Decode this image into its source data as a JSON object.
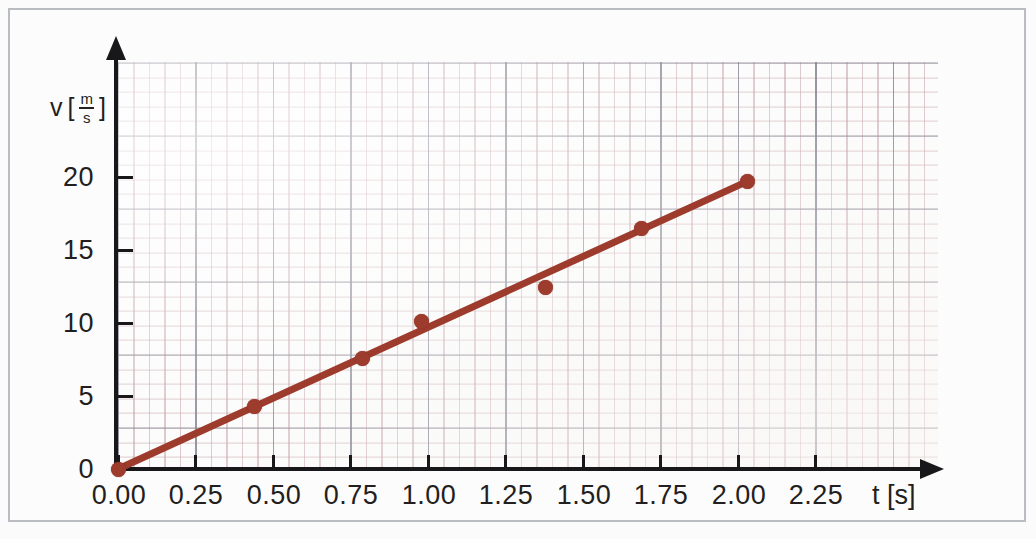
{
  "figure": {
    "kind": "velocity-time-diagram",
    "line_color": "#9d3b2d",
    "point_color": "#9d3b2d",
    "axis_color": "#18181a",
    "grid_color": "#c4a0a5",
    "grid_major_color": "#808492",
    "frame_color": "#b9bcc0",
    "background": "#fcfcfc"
  },
  "axes": {
    "y": {
      "symbol": "v",
      "unit_open": "[",
      "unit_num": "m",
      "unit_den": "s",
      "unit_close": "]",
      "label_text": "v [m/s]",
      "ticks": [
        "0",
        "5",
        "10",
        "15",
        "20"
      ],
      "tick_values": [
        0,
        5,
        10,
        15,
        20
      ]
    },
    "x": {
      "label_text": "t [s]",
      "ticks": [
        "0.00",
        "0.25",
        "0.50",
        "0.75",
        "1.00",
        "1.25",
        "1.50",
        "1.75",
        "2.00",
        "2.25"
      ],
      "tick_values": [
        0.0,
        0.25,
        0.5,
        0.75,
        1.0,
        1.25,
        1.5,
        1.75,
        2.0,
        2.25
      ]
    }
  },
  "chart_data": {
    "type": "scatter",
    "title": "",
    "xlabel": "t [s]",
    "ylabel": "v [m/s]",
    "xlim": [
      0.0,
      2.5
    ],
    "ylim": [
      0,
      22
    ],
    "grid": true,
    "legend": "none",
    "series": [
      {
        "name": "measured points",
        "kind": "scatter",
        "color": "#9d3b2d",
        "marker": "filled-circle",
        "x": [
          0.0,
          0.44,
          0.79,
          0.98,
          1.38,
          1.69,
          2.03
        ],
        "y": [
          0.0,
          4.3,
          7.6,
          10.1,
          12.4,
          16.5,
          19.7
        ],
        "points": [
          {
            "t": 0.0,
            "v": 0.0,
            "on_line": true
          },
          {
            "t": 0.44,
            "v": 4.3,
            "on_line": true
          },
          {
            "t": 0.79,
            "v": 7.6,
            "on_line": true
          },
          {
            "t": 0.98,
            "v": 10.1,
            "on_line": true
          },
          {
            "t": 1.38,
            "v": 12.4,
            "on_line": false
          },
          {
            "t": 1.69,
            "v": 16.5,
            "on_line": true
          },
          {
            "t": 2.03,
            "v": 19.7,
            "on_line": true
          }
        ]
      },
      {
        "name": "best-fit line",
        "kind": "line",
        "color": "#9d3b2d",
        "x": [
          0.0,
          2.03
        ],
        "y": [
          0.0,
          19.7
        ],
        "slope": 9.7,
        "intercept": 0.0
      }
    ],
    "x_tick_labels": [
      "0.00",
      "0.25",
      "0.50",
      "0.75",
      "1.00",
      "1.25",
      "1.50",
      "1.75",
      "2.00",
      "2.25"
    ],
    "y_tick_labels": [
      "0",
      "5",
      "10",
      "15",
      "20"
    ]
  },
  "geometry": {
    "origin_px": {
      "x": 108,
      "y": 459
    },
    "x_px_per_unit": 310,
    "y_px_per_unit": 14.6
  }
}
